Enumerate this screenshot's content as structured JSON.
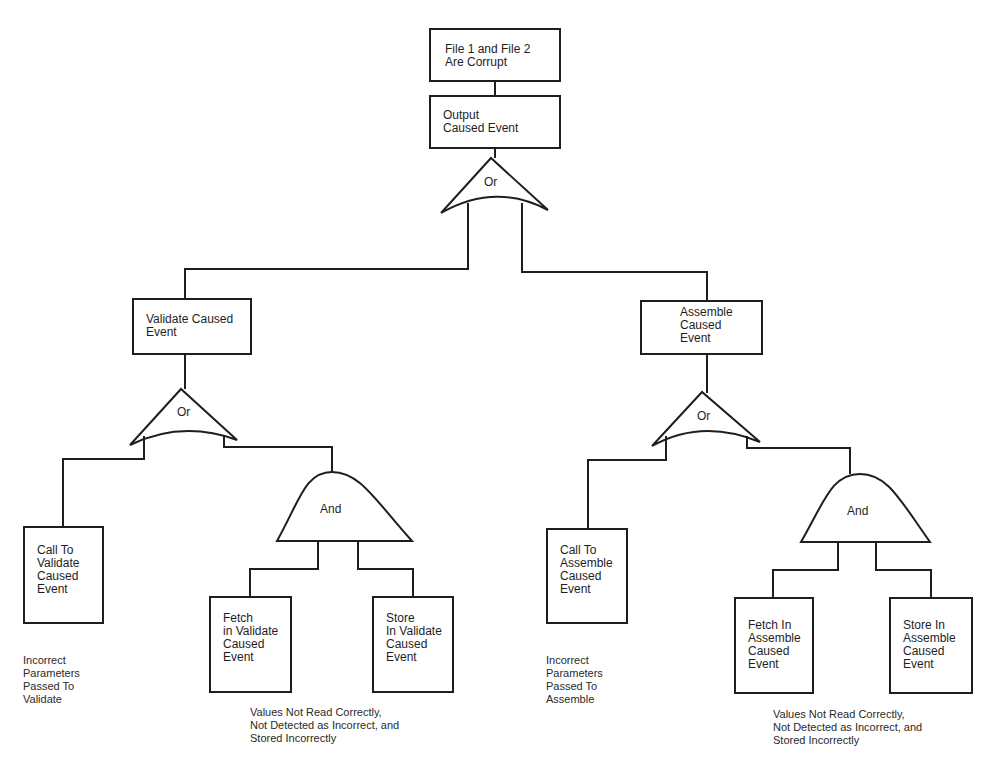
{
  "colors": {
    "stroke": "#1e1e1e",
    "background": "#ffffff"
  },
  "nodes": {
    "top_event": {
      "label": "File 1 and File 2\nAre Corrupt"
    },
    "output_caused": {
      "label": "Output\nCaused Event"
    },
    "top_or_gate": {
      "label": "Or",
      "type": "or-gate"
    },
    "validate_caused": {
      "label": "Validate Caused\nEvent"
    },
    "assemble_caused": {
      "label": "Assemble\nCaused\nEvent"
    },
    "validate_or_gate": {
      "label": "Or",
      "type": "or-gate"
    },
    "assemble_or_gate": {
      "label": "Or",
      "type": "or-gate"
    },
    "validate_and_gate": {
      "label": "And",
      "type": "and-gate"
    },
    "assemble_and_gate": {
      "label": "And",
      "type": "and-gate"
    },
    "call_to_validate": {
      "label": "Call To\nValidate\nCaused\nEvent"
    },
    "fetch_in_validate": {
      "label": "Fetch\nin Validate\nCaused\nEvent"
    },
    "store_in_validate": {
      "label": "Store\nIn Validate\nCaused\nEvent"
    },
    "call_to_assemble": {
      "label": "Call To\nAssemble\nCaused\nEvent"
    },
    "fetch_in_assemble": {
      "label": "Fetch In\nAssemble\nCaused\nEvent"
    },
    "store_in_assemble": {
      "label": "Store In\nAssemble\nCaused\nEvent"
    }
  },
  "notes": {
    "validate_params": "Incorrect\nParameters\nPassed To\nValidate",
    "validate_values": "Values Not Read Correctly,\nNot Detected as Incorrect, and\nStored Incorrectly",
    "assemble_params": "Incorrect\nParameters\nPassed To\nAssemble",
    "assemble_values": "Values Not Read Correctly,\nNot Detected as Incorrect, and\nStored Incorrectly"
  }
}
